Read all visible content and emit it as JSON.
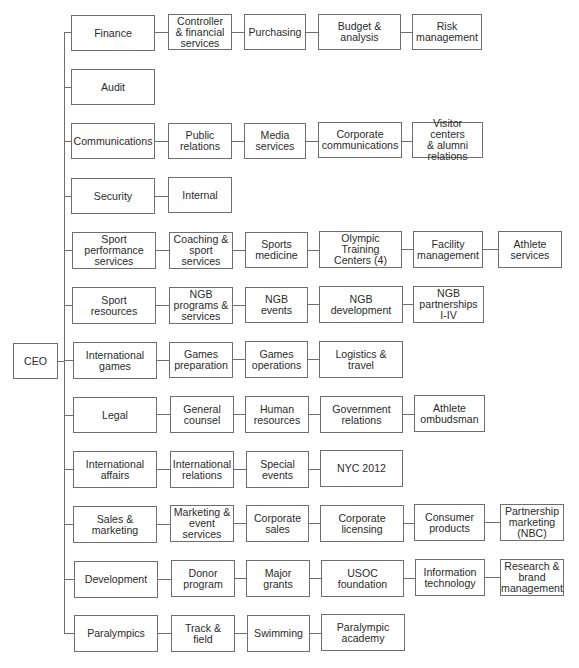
{
  "diagram": {
    "type": "org-chart",
    "root": {
      "label": "CEO"
    },
    "departments": [
      {
        "label": "Finance",
        "children": [
          "Controller\n& financial\nservices",
          "Purchasing",
          "Budget &\nanalysis",
          "Risk\nmanagement"
        ]
      },
      {
        "label": "Audit",
        "children": []
      },
      {
        "label": "Communications",
        "children": [
          "Public\nrelations",
          "Media\nservices",
          "Corporate\ncommunications",
          "Visitor centers\n& alumni\nrelations"
        ]
      },
      {
        "label": "Security",
        "children": [
          "Internal"
        ]
      },
      {
        "label": "Sport\nperformance\nservices",
        "children": [
          "Coaching &\nsport\nservices",
          "Sports\nmedicine",
          "Olympic\nTraining\nCenters (4)",
          "Facility\nmanagement",
          "Athlete\nservices"
        ]
      },
      {
        "label": "Sport\nresources",
        "children": [
          "NGB\nprograms &\nservices",
          "NGB\nevents",
          "NGB\ndevelopment",
          "NGB\npartnerships\nI-IV"
        ]
      },
      {
        "label": "International\ngames",
        "children": [
          "Games\npreparation",
          "Games\noperations",
          "Logistics &\ntravel"
        ]
      },
      {
        "label": "Legal",
        "children": [
          "General\ncounsel",
          "Human\nresources",
          "Government\nrelations",
          "Athlete\nombudsman"
        ]
      },
      {
        "label": "International\naffairs",
        "children": [
          "International\nrelations",
          "Special\nevents",
          "NYC 2012"
        ]
      },
      {
        "label": "Sales &\nmarketing",
        "children": [
          "Marketing &\nevent\nservices",
          "Corporate\nsales",
          "Corporate\nlicensing",
          "Consumer\nproducts",
          "Partnership\nmarketing\n(NBC)"
        ]
      },
      {
        "label": "Development",
        "children": [
          "Donor\nprogram",
          "Major grants",
          "USOC\nfoundation",
          "Information\ntechnology",
          "Research &\nbrand\nmanagement"
        ]
      },
      {
        "label": "Paralympics",
        "children": [
          "Track & field",
          "Swimming",
          "Paralympic\nacademy"
        ]
      }
    ]
  },
  "colors": {
    "line": "#6e6e6e",
    "text": "#2b2b2b",
    "background": "#ffffff"
  }
}
